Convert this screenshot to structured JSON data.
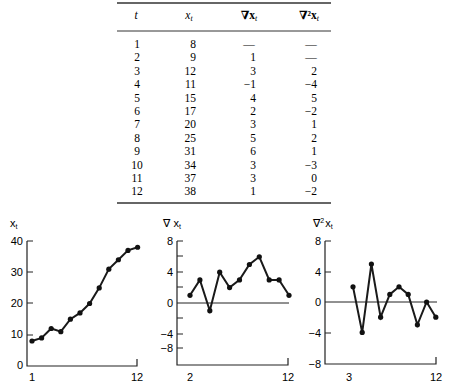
{
  "table": {
    "headers": [
      "t",
      "x",
      "∇x",
      "∇²x"
    ],
    "header_subscript": "t",
    "rows": [
      {
        "t": "1",
        "x": "8",
        "d1": "—",
        "d2": "—"
      },
      {
        "t": "2",
        "x": "9",
        "d1": "1",
        "d2": "—"
      },
      {
        "t": "3",
        "x": "12",
        "d1": "3",
        "d2": "2"
      },
      {
        "t": "4",
        "x": "11",
        "d1": "−1",
        "d2": "−4"
      },
      {
        "t": "5",
        "x": "15",
        "d1": "4",
        "d2": "5"
      },
      {
        "t": "6",
        "x": "17",
        "d1": "2",
        "d2": "−2"
      },
      {
        "t": "7",
        "x": "20",
        "d1": "3",
        "d2": "1"
      },
      {
        "t": "8",
        "x": "25",
        "d1": "5",
        "d2": "2"
      },
      {
        "t": "9",
        "x": "31",
        "d1": "6",
        "d2": "1"
      },
      {
        "t": "10",
        "x": "34",
        "d1": "3",
        "d2": "−3"
      },
      {
        "t": "11",
        "x": "37",
        "d1": "3",
        "d2": "0"
      },
      {
        "t": "12",
        "x": "38",
        "d1": "1",
        "d2": "−2"
      }
    ]
  },
  "chart_data": [
    {
      "type": "line",
      "title": "",
      "ylabel": "x_t",
      "xlabel": "",
      "x": [
        1,
        2,
        3,
        4,
        5,
        6,
        7,
        8,
        9,
        10,
        11,
        12
      ],
      "values": [
        8,
        9,
        12,
        11,
        15,
        17,
        20,
        25,
        31,
        34,
        37,
        38
      ],
      "xticks": [
        "1",
        "12"
      ],
      "yticks": [
        "0",
        "10",
        "20",
        "30",
        "40"
      ],
      "ylim": [
        0,
        40
      ],
      "zero_line": false,
      "grid": false
    },
    {
      "type": "line",
      "title": "",
      "ylabel": "∇ x_t",
      "xlabel": "",
      "x": [
        2,
        3,
        4,
        5,
        6,
        7,
        8,
        9,
        10,
        11,
        12
      ],
      "values": [
        1,
        3,
        -1,
        4,
        2,
        3,
        5,
        6,
        3,
        3,
        1
      ],
      "xticks": [
        "2",
        "12"
      ],
      "yticks": [
        "8",
        "4",
        "0",
        "−4",
        "−8"
      ],
      "ylim": [
        -8,
        8
      ],
      "zero_line": true,
      "grid": false
    },
    {
      "type": "line",
      "title": "",
      "ylabel": "∇² x_t",
      "xlabel": "",
      "x": [
        3,
        4,
        5,
        6,
        7,
        8,
        9,
        10,
        11,
        12
      ],
      "values": [
        2,
        -4,
        5,
        -2,
        1,
        2,
        1,
        -3,
        0,
        -2
      ],
      "xticks": [
        "3",
        "12"
      ],
      "yticks": [
        "8",
        "4",
        "0",
        "−4",
        "−8"
      ],
      "ylim": [
        -8,
        8
      ],
      "zero_line": true,
      "grid": false
    }
  ],
  "charts": {
    "c1": {
      "ylabel_main": "x",
      "ylabel_sub": "t",
      "xt_left": "1",
      "xt_right": "12",
      "yt0": "40",
      "yt1": "30",
      "yt2": "20",
      "yt3": "10",
      "yt4": "0"
    },
    "c2": {
      "ylabel_main": "∇ x",
      "ylabel_sub": "t",
      "xt_left": "2",
      "xt_right": "12",
      "yt0": "8",
      "yt1": "4",
      "yt2": "0",
      "yt3": "−4",
      "yt4": "−8"
    },
    "c3": {
      "ylabel_main": "∇",
      "ylabel_sup": "2",
      "ylabel_x": "x",
      "ylabel_sub": "t",
      "xt_left": "3",
      "xt_right": "12",
      "yt0": "8",
      "yt1": "4",
      "yt2": "0",
      "yt3": "−4",
      "yt4": "−8"
    }
  }
}
